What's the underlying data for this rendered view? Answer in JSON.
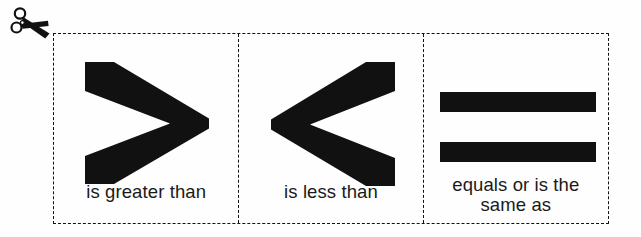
{
  "worksheet": {
    "title": "Comparison symbol flash cards",
    "background_color": "#fefefe",
    "ink_color": "#111111",
    "cut_icon": {
      "name": "scissors-icon",
      "label": "cut along dashed line"
    },
    "cards": [
      {
        "id": "greater-than",
        "symbol": ">",
        "symbol_name": "greater-than-symbol",
        "caption_lines": [
          "is greater than"
        ]
      },
      {
        "id": "less-than",
        "symbol": "<",
        "symbol_name": "less-than-symbol",
        "caption_lines": [
          "is less than"
        ]
      },
      {
        "id": "equals",
        "symbol": "=",
        "symbol_name": "equals-symbol",
        "caption_lines": [
          "equals or is the",
          "same as"
        ]
      }
    ]
  }
}
